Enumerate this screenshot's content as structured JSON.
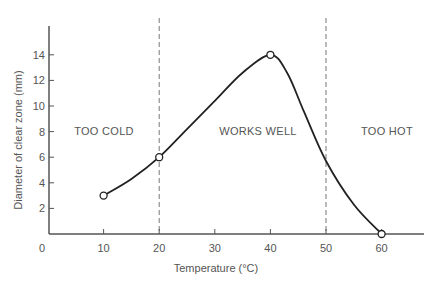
{
  "chart_data": {
    "type": "line",
    "title": "",
    "xlabel": "Temperature (°C)",
    "ylabel": "Diameter of clear zone (mm)",
    "xlim": [
      0,
      68
    ],
    "ylim": [
      0,
      16
    ],
    "x_ticks": [
      0,
      10,
      20,
      30,
      40,
      50,
      60
    ],
    "y_ticks": [
      2,
      4,
      6,
      8,
      10,
      12,
      14
    ],
    "grid": false,
    "legend": null,
    "series": [
      {
        "name": "Clear zone diameter",
        "points": [
          {
            "x": 10,
            "y": 3
          },
          {
            "x": 20,
            "y": 6
          },
          {
            "x": 40,
            "y": 14
          },
          {
            "x": 60,
            "y": 0
          }
        ],
        "interpolated_curve": [
          {
            "x": 10,
            "y": 3
          },
          {
            "x": 15,
            "y": 4.3
          },
          {
            "x": 20,
            "y": 6
          },
          {
            "x": 25,
            "y": 8.2
          },
          {
            "x": 30,
            "y": 10.4
          },
          {
            "x": 35,
            "y": 12.6
          },
          {
            "x": 40,
            "y": 14
          },
          {
            "x": 43,
            "y": 12.6
          },
          {
            "x": 46,
            "y": 9.6
          },
          {
            "x": 50,
            "y": 5.7
          },
          {
            "x": 55,
            "y": 2.3
          },
          {
            "x": 60,
            "y": 0
          }
        ],
        "markers": "open-circle",
        "color": "#222222"
      }
    ],
    "vertical_reference_lines": [
      {
        "x": 20,
        "style": "dashed"
      },
      {
        "x": 50,
        "style": "dashed"
      }
    ],
    "annotations": [
      {
        "text": "TOO COLD",
        "x": 11,
        "y": 8
      },
      {
        "text": "WORKS WELL",
        "x": 35,
        "y": 8
      },
      {
        "text": "TOO HOT",
        "x": 58,
        "y": 8
      }
    ]
  }
}
